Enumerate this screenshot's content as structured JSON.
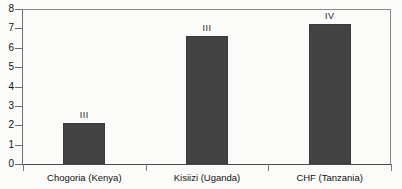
{
  "chart_data": {
    "type": "bar",
    "title": "",
    "subtitle": "",
    "xlabel": "",
    "ylabel": "",
    "categories": [
      "Chogoria (Kenya)",
      "Kisiizi (Uganda)",
      "CHF (Tanzania)"
    ],
    "values": [
      2.1,
      6.6,
      7.25
    ],
    "bar_labels": [
      "III",
      "III",
      "IV"
    ],
    "ylim": [
      0,
      8
    ],
    "ytick_labels": [
      "0",
      "1",
      "2",
      "3",
      "4",
      "5",
      "6",
      "7",
      "8"
    ],
    "ytick_values": [
      0,
      1,
      2,
      3,
      4,
      5,
      6,
      7,
      8
    ],
    "grid": false,
    "legend": "none",
    "series": [
      {
        "name": "",
        "values": [
          2.1,
          6.6,
          7.25
        ],
        "point_labels": [
          "III",
          "III",
          "IV"
        ]
      }
    ],
    "colors": {
      "bar_fill": "#434343",
      "bar_stroke": "#3a3a3a",
      "axis": "#6e6e6e",
      "text": "#111111",
      "background": "#fbfbf9"
    }
  }
}
